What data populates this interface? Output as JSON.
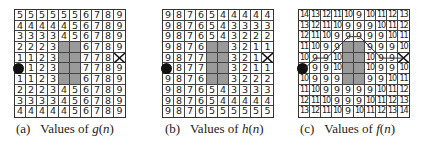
{
  "panels": [
    {
      "id": "a",
      "caption_prefix": "(a)",
      "caption_text": "Values of ",
      "caption_func": "g",
      "caption_arg": "(n)",
      "grid": [
        [
          "5",
          "5",
          "5",
          "5",
          "5",
          "5",
          "6",
          "7",
          "8",
          "9"
        ],
        [
          "4",
          "4",
          "4",
          "4",
          "4",
          "5",
          "6",
          "7",
          "8",
          "9"
        ],
        [
          "3",
          "3",
          "3",
          "3",
          "4",
          "5",
          "6",
          "7",
          "8",
          "9"
        ],
        [
          "2",
          "2",
          "2",
          "3",
          "",
          "",
          "6",
          "7",
          "8",
          "9"
        ],
        [
          "1",
          "1",
          "2",
          "3",
          "",
          "",
          "7",
          "7",
          "8",
          ""
        ],
        [
          "",
          "1",
          "2",
          "3",
          "",
          "",
          "7",
          "7",
          "8",
          "9"
        ],
        [
          "1",
          "1",
          "2",
          "3",
          "",
          "",
          "6",
          "7",
          "8",
          "9"
        ],
        [
          "2",
          "2",
          "2",
          "3",
          "4",
          "5",
          "6",
          "7",
          "8",
          "9"
        ],
        [
          "3",
          "3",
          "3",
          "3",
          "4",
          "5",
          "6",
          "7",
          "8",
          "9"
        ],
        [
          "4",
          "4",
          "4",
          "4",
          "4",
          "5",
          "6",
          "7",
          "8",
          "9"
        ]
      ]
    },
    {
      "id": "b",
      "caption_prefix": "(b)",
      "caption_text": "Values of ",
      "caption_func": "h",
      "caption_arg": "(n)",
      "grid": [
        [
          "9",
          "8",
          "7",
          "6",
          "5",
          "4",
          "4",
          "4",
          "4",
          "4"
        ],
        [
          "9",
          "8",
          "7",
          "6",
          "5",
          "4",
          "3",
          "3",
          "3",
          "3"
        ],
        [
          "9",
          "8",
          "7",
          "6",
          "5",
          "4",
          "3",
          "2",
          "2",
          "2"
        ],
        [
          "9",
          "8",
          "7",
          "6",
          "",
          "",
          "3",
          "2",
          "1",
          "1"
        ],
        [
          "9",
          "8",
          "7",
          "7",
          "",
          "",
          "3",
          "2",
          "1",
          ""
        ],
        [
          "",
          "8",
          "7",
          "7",
          "",
          "",
          "3",
          "2",
          "1",
          "1"
        ],
        [
          "9",
          "8",
          "7",
          "6",
          "",
          "",
          "3",
          "2",
          "2",
          "2"
        ],
        [
          "9",
          "8",
          "7",
          "6",
          "5",
          "4",
          "3",
          "3",
          "3",
          "3"
        ],
        [
          "9",
          "8",
          "7",
          "6",
          "5",
          "4",
          "4",
          "4",
          "4",
          "4"
        ],
        [
          "9",
          "8",
          "7",
          "6",
          "5",
          "5",
          "5",
          "5",
          "5",
          "5"
        ]
      ]
    },
    {
      "id": "c",
      "caption_prefix": "(c)",
      "caption_text": "Values of ",
      "caption_func": "f",
      "caption_arg": "(n)",
      "grid": [
        [
          "14",
          "13",
          "12",
          "11",
          "10",
          "9",
          "10",
          "11",
          "12",
          "13"
        ],
        [
          "13",
          "12",
          "11",
          "10",
          "9",
          "9",
          "9",
          "10",
          "11",
          "12"
        ],
        [
          "12",
          "11",
          "10",
          "9",
          "9",
          "9",
          "9",
          "9",
          "10",
          "11"
        ],
        [
          "11",
          "10",
          "9",
          "9",
          "",
          "",
          "9",
          "9",
          "9",
          "10"
        ],
        [
          "10",
          "9",
          "9",
          "10",
          "",
          "",
          "10",
          "9",
          "9",
          ""
        ],
        [
          "",
          "9",
          "9",
          "10",
          "",
          "",
          "10",
          "9",
          "9",
          "10"
        ],
        [
          "10",
          "9",
          "9",
          "9",
          "",
          "",
          "9",
          "9",
          "10",
          "11"
        ],
        [
          "11",
          "10",
          "9",
          "9",
          "9",
          "9",
          "9",
          "10",
          "11",
          "12"
        ],
        [
          "12",
          "11",
          "10",
          "9",
          "9",
          "9",
          "10",
          "11",
          "12",
          "13"
        ],
        [
          "13",
          "12",
          "11",
          "10",
          "9",
          "10",
          "11",
          "12",
          "13",
          "14"
        ]
      ]
    }
  ],
  "obstacle_cells": [
    [
      3,
      4
    ],
    [
      3,
      5
    ],
    [
      4,
      4
    ],
    [
      4,
      5
    ],
    [
      5,
      4
    ],
    [
      5,
      5
    ],
    [
      6,
      4
    ],
    [
      6,
      5
    ]
  ],
  "start_cell": [
    5,
    0
  ],
  "goal_cell": [
    4,
    9
  ],
  "path_cells_c": [
    [
      5,
      0
    ],
    [
      4,
      1
    ],
    [
      4,
      2
    ],
    [
      3,
      3
    ],
    [
      2,
      4
    ],
    [
      2,
      5
    ],
    [
      3,
      6
    ],
    [
      4,
      7
    ],
    [
      4,
      8
    ],
    [
      4,
      9
    ]
  ],
  "colors": {
    "obstacle": "#9a9a9a",
    "grid_line": "#444444",
    "start": "#111111",
    "goal": "#111111",
    "path": "#333333"
  },
  "icons": {
    "start": "filled-circle",
    "goal": "x-cross"
  }
}
